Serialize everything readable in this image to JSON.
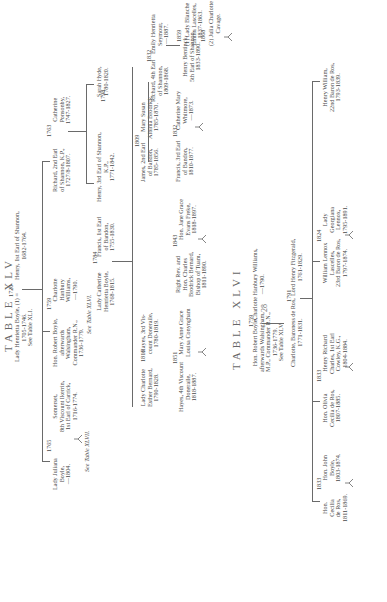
{
  "page": {
    "page_number": "28",
    "orientation": "rotated-90-ccw"
  },
  "table45": {
    "title": "TABLE XLV",
    "root": {
      "left": "Lady Henrietta Boyle, (1) =\n1705-1746.\nSee Table XLI.",
      "marriage_year": "1726",
      "right": "Henry, 1st Earl of Shannon,\n1682-1764."
    },
    "gen2": [
      {
        "name": "Richard, 2nd Earl\nof Shannon, K.P.,\n1727/8-1807.",
        "marriage_year": "1763",
        "spouse": "Catherine\nPonsonby,\n1747-1827."
      },
      {
        "name": "Hon. Robert Boyle,\nafterwards\nWalsingham,\nCommander R.N.,\n1736-1779.",
        "marriage_year": "1759",
        "spouse": "Charlotte\nHanbury\nWilliams,\n—1790.",
        "note": "See Table XLVI."
      },
      {
        "name": "Lady Juliana\nBoyle,\n—1804.",
        "marriage_year": "1765",
        "spouse": "Somerset,\n8th Viscount Ikerrin,\n1st Earl of Carrick,\n1716-1774.",
        "note": "See Table XLVII."
      }
    ],
    "gen3": [
      {
        "name": "Henry, 3rd Earl of Shannon,\nK.P.,\n1771-1842.",
        "marriage_year": "1798",
        "spouse": "Sarah Hyde,\n1780-1820."
      },
      {
        "name": "Lady Catherine\nHenrietta Boyle,\n1768-1815.",
        "marriage_year": "1784",
        "spouse": "Francis, 1st Earl\nof Bandon,\n1755-1830."
      }
    ],
    "gen3b": [
      {
        "name": "Lady Charlotte\nEsther Bernard,\n1790-1828.",
        "marriage_year": "1816",
        "spouse": "Hayes, 3rd Vis-\ncount Doneraile,\n1780-1819."
      }
    ],
    "gen4": [
      {
        "name": "Richard, 4th Earl\nof Shannon,\n1809-1868.",
        "marriage_year": "1832",
        "spouse": "Emily Henrietta\nSeymour,\n—1887."
      },
      {
        "name": "James, 2nd Earl\nof Bandon,\n1785-1856.",
        "marriage_year": "1809",
        "spouse": "Mary Susan\nAlbinia Brodrick,\n1785-1870."
      },
      {
        "name": "Right Rev. and\nHon. Charles\nBrodrick Bernard,\nBishop of Tuam,\n1811-1890.",
        "marriage_year": "1843",
        "spouse": "Hon. Jane Grace\nEvans Freke,\n1818-1897."
      },
      {
        "name": "Hayes, 4th Viscount\nDoneraile,\n1818-1887.",
        "marriage_year": "1851",
        "spouse": "Mary Anne Grace\nLouisa Conyngham"
      }
    ],
    "gen5": [
      {
        "name": "Francis, 3rd Earl\nof Bandon,\n1810-1877.",
        "marriage_year": "1832",
        "spouse": "Catherine Mary\nWhitmore,\n—1873."
      }
    ],
    "gen6": [
      {
        "name": "Henry Bentinck,\n5th Earl of Shannon,\n1833-1890.",
        "marriage_year1": "1859",
        "spouse1": "(1) Lady Blanche\nEmma Lascelles,\n1837-1863.",
        "marriage_year2": "1868",
        "spouse2": "(2) Julia Charlotte\nCavage."
      }
    ]
  },
  "table46": {
    "title": "TABLE XLVI",
    "root": {
      "left": "Hon. Robert Boyle,\nafterwards Walsingham,\nM.P., Commander R.N.,\n1736-1779.\nSee Table XLV.",
      "marriage_year": "1759",
      "right": "Charlotte Hanbury Williams,\n—1790."
    },
    "gen2": {
      "name": "Charlotte, Baroness de Ros,\n1771-1831.",
      "marriage_year": "1791",
      "spouse": "Lord Henry Fitzgerald,\n1761-1829."
    },
    "gen3": [
      {
        "name": "Henry William,\n22nd Baron de Ros,\n1793-1839."
      },
      {
        "name": "William Lennox\nLascelles,\n23rd Baron de Ros,\n1797-1874.",
        "marriage_year": "1824",
        "spouse": "Lady\nGeorgiana\nLennox,\n1795-1891."
      },
      {
        "name": "Hon. Olivia\nCecilia de Ros,\n1807-1885.",
        "marriage_year": "1833",
        "spouse": "Henry Richard\nCharles, 1st Earl\nCowley, K.G.,\n1804-1884."
      },
      {
        "name": "Hon.\nCecilia\nde Ros,\n1811-1869.",
        "marriage_year": "1833",
        "spouse": "Hon. John\nBoyle,\n1803-1874."
      }
    ]
  }
}
